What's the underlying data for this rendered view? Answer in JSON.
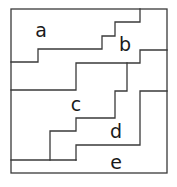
{
  "diagram": {
    "type": "region-partition",
    "regions": [
      {
        "id": "a",
        "label": "a",
        "x": 41,
        "y": 30
      },
      {
        "id": "b",
        "label": "b",
        "x": 125,
        "y": 44
      },
      {
        "id": "c",
        "label": "c",
        "x": 76,
        "y": 104
      },
      {
        "id": "d",
        "label": "d",
        "x": 116,
        "y": 131
      },
      {
        "id": "e",
        "label": "e",
        "x": 116,
        "y": 162
      }
    ],
    "stroke_color": "#3a3a3a",
    "background": "#ffffff"
  }
}
